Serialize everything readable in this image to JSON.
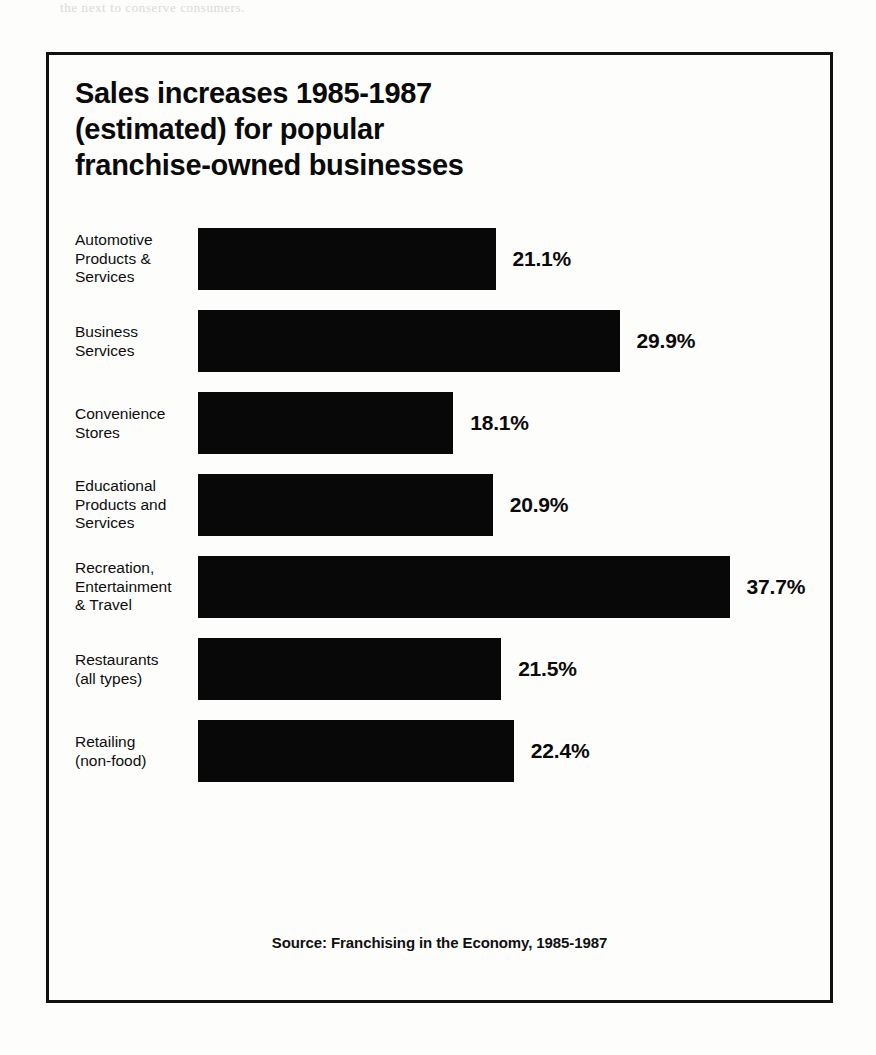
{
  "scan_artifacts": {
    "top_ghost_text": "the next to conserve consumers.",
    "right_ghost_text": "",
    "bottom_ghost_text": ""
  },
  "chart": {
    "title_lines": [
      "Sales increases 1985-1987",
      "(estimated) for popular",
      "franchise-owned businesses"
    ],
    "source": "Source: Franchising in the Economy, 1985-1987",
    "bar_color": "#080808",
    "frame_color": "#111111",
    "page_color": "#fdfdfb"
  },
  "chart_data": {
    "type": "bar",
    "orientation": "horizontal",
    "title": "Sales increases 1985-1987 (estimated) for popular franchise-owned businesses",
    "subtitle": "",
    "xlabel": "",
    "ylabel": "",
    "xlim": [
      0,
      37.7
    ],
    "grid": false,
    "legend": false,
    "value_suffix": "%",
    "source": "Source: Franchising in the Economy, 1985-1987",
    "categories": [
      "Automotive\nProducts &\nServices",
      "Business\nServices",
      "Convenience\nStores",
      "Educational\nProducts and\nServices",
      "Recreation,\nEntertainment\n& Travel",
      "Restaurants\n(all types)",
      "Retailing\n(non-food)"
    ],
    "values": [
      21.1,
      29.9,
      18.1,
      20.9,
      37.7,
      21.5,
      22.4
    ],
    "value_labels": [
      "21.1%",
      "29.9%",
      "18.1%",
      "20.9%",
      "37.7%",
      "21.5%",
      "22.4%"
    ]
  }
}
